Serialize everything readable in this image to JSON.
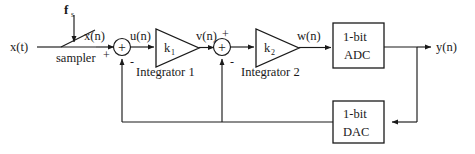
{
  "diagram": {
    "colors": {
      "line": "#1a1a1a",
      "background": "#ffffff",
      "text": "#1a1a1a"
    },
    "signals": {
      "input_analog": "x(t)",
      "sampled": "x(n)",
      "sampler_label": "sampler",
      "sample_rate_symbol": "f",
      "sample_rate_subscript": "s",
      "first_sum_out": "u(n)",
      "first_gain_out": "v(n)",
      "second_gain_out": "w(n)",
      "output": "y(n)"
    },
    "gains": [
      {
        "symbol": "k",
        "subscript": "1",
        "caption": "Integrator 1"
      },
      {
        "symbol": "k",
        "subscript": "2",
        "caption": "Integrator 2"
      }
    ],
    "blocks": [
      {
        "name": "adc",
        "line1": "1-bit",
        "line2": "ADC"
      },
      {
        "name": "dac",
        "line1": "1-bit",
        "line2": "DAC"
      }
    ],
    "summers": [
      {
        "name": "summer-1",
        "center": "+",
        "input_plus": "+",
        "input_minus": "-"
      },
      {
        "name": "summer-2",
        "center": "+",
        "input_plus": "+",
        "input_minus": "-"
      }
    ],
    "signs": {
      "plus": "+",
      "minus": "-"
    }
  }
}
